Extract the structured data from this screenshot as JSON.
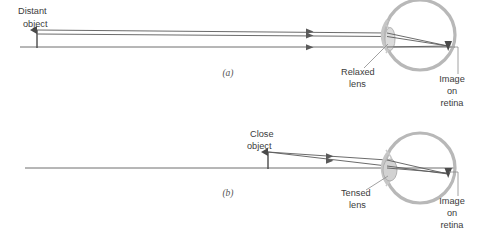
{
  "figure": {
    "title_text": "",
    "colors": {
      "ray": "#5a5a5a",
      "axis": "#6e6e6e",
      "eye_outline": "#b3b3b3",
      "lens_fill": "#d9d9d9",
      "lens_outline": "#b0b0b0",
      "text": "#3b3b3b",
      "leader": "#8a8a8a",
      "background": "#ffffff"
    },
    "panels": [
      {
        "id": "panel-a",
        "letter": "(a)",
        "letter_x": 228,
        "letter_y": 76,
        "object_label_line1": "Distant",
        "object_label_line2": "object",
        "object_label_x": 18,
        "object_label_y1": 14,
        "object_label_y2": 27,
        "lens_label_line1": "Relaxed",
        "lens_label_line2": "lens",
        "lens_label_x": 341,
        "lens_label_y1": 74,
        "lens_label_y2": 86,
        "image_label_line1": "Image",
        "image_label_line2": "on",
        "image_label_line3": "retina",
        "image_label_x": 452,
        "image_label_y1": 81,
        "image_label_y2": 93,
        "image_label_y3": 105,
        "axis_y": 47,
        "axis_x1": 20,
        "axis_x2": 455,
        "object_arrow_x": 37,
        "object_arrow_top": 30,
        "object_arrow_bottom": 48,
        "eye_cx": 420,
        "eye_cy": 35,
        "eye_r": 35,
        "lens_cx": 389,
        "lens_cy": 40,
        "lens_rx": 5.5,
        "lens_ry": 11,
        "focus_x": 448,
        "focus_y": 47,
        "rays": [
          {
            "x1": 37,
            "y1": 30,
            "x2": 386,
            "y2": 33
          },
          {
            "x1": 37,
            "y1": 34,
            "x2": 386,
            "y2": 36
          },
          {
            "x1": 37,
            "y1": 47,
            "x2": 386,
            "y2": 47
          }
        ],
        "ray_arrow_x": 310
      },
      {
        "id": "panel-b",
        "letter": "(b)",
        "letter_x": 228,
        "letter_y": 196,
        "object_label_line1": "Close",
        "object_label_line2": "object",
        "object_label_x": 250,
        "object_label_y1": 136,
        "object_label_y2": 148,
        "lens_label_line1": "Tensed",
        "lens_label_line2": "lens",
        "lens_label_x": 341,
        "lens_label_y1": 195,
        "lens_label_y2": 207,
        "image_label_line1": "Image",
        "image_label_line2": "on",
        "image_label_line3": "retina",
        "image_label_x": 452,
        "image_label_y1": 203,
        "image_label_y2": 215,
        "image_label_y3": 227,
        "axis_y": 168,
        "axis_x1": 25,
        "axis_x2": 455,
        "object_arrow_x": 268,
        "object_arrow_top": 152,
        "object_arrow_bottom": 169,
        "eye_cx": 420,
        "eye_cy": 168,
        "eye_r": 35,
        "lens_cx": 389,
        "lens_cy": 170,
        "lens_rx": 6.5,
        "lens_ry": 11,
        "focus_x": 448,
        "focus_y": 175,
        "rays": [
          {
            "x1": 268,
            "y1": 152,
            "x2": 386,
            "y2": 161
          },
          {
            "x1": 268,
            "y1": 152,
            "x2": 386,
            "y2": 166
          },
          {
            "x1": 268,
            "y1": 168,
            "x2": 386,
            "y2": 168
          }
        ],
        "ray_arrow_x": 332
      }
    ]
  }
}
